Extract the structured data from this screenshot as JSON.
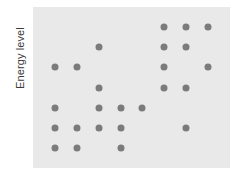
{
  "figure": {
    "background_color": "#ffffff",
    "panel_color": "#e9e9e9"
  },
  "axes": {
    "ylabel": "Energy level",
    "xlabel": ""
  },
  "chart_data": {
    "type": "scatter",
    "title": "",
    "subtitle": "",
    "xlabel": "",
    "ylabel": "Energy level",
    "grid": false,
    "legend": null,
    "marker": {
      "shape": "circle",
      "color": "#7b7b7b",
      "size_px": 7
    },
    "xlim": [
      0,
      9
    ],
    "ylim": [
      0,
      8
    ],
    "xticks": [],
    "yticks": [],
    "x": [
      6,
      7,
      8,
      3,
      6,
      7,
      1,
      2,
      6,
      8,
      3,
      6,
      7,
      1,
      3,
      4,
      5,
      1,
      2,
      3,
      4,
      7,
      1,
      2,
      4
    ],
    "y": [
      7,
      7,
      7,
      6,
      6,
      6,
      5,
      5,
      5,
      5,
      4,
      4,
      4,
      3,
      3,
      3,
      3,
      2,
      2,
      2,
      2,
      2,
      1,
      1,
      1
    ],
    "points": [
      {
        "x": 6,
        "y": 7
      },
      {
        "x": 7,
        "y": 7
      },
      {
        "x": 8,
        "y": 7
      },
      {
        "x": 3,
        "y": 6
      },
      {
        "x": 6,
        "y": 6
      },
      {
        "x": 7,
        "y": 6
      },
      {
        "x": 1,
        "y": 5
      },
      {
        "x": 2,
        "y": 5
      },
      {
        "x": 6,
        "y": 5
      },
      {
        "x": 8,
        "y": 5
      },
      {
        "x": 3,
        "y": 4
      },
      {
        "x": 6,
        "y": 4
      },
      {
        "x": 7,
        "y": 4
      },
      {
        "x": 1,
        "y": 3
      },
      {
        "x": 3,
        "y": 3
      },
      {
        "x": 4,
        "y": 3
      },
      {
        "x": 5,
        "y": 3
      },
      {
        "x": 1,
        "y": 2
      },
      {
        "x": 2,
        "y": 2
      },
      {
        "x": 3,
        "y": 2
      },
      {
        "x": 4,
        "y": 2
      },
      {
        "x": 7,
        "y": 2
      },
      {
        "x": 1,
        "y": 1
      },
      {
        "x": 2,
        "y": 1
      },
      {
        "x": 4,
        "y": 1
      }
    ],
    "point_count": 25,
    "rows": [
      {
        "level": 7,
        "columns": [
          6,
          7,
          8
        ],
        "count": 3
      },
      {
        "level": 6,
        "columns": [
          3,
          6,
          7
        ],
        "count": 3
      },
      {
        "level": 5,
        "columns": [
          1,
          2,
          6,
          8
        ],
        "count": 4
      },
      {
        "level": 4,
        "columns": [
          3,
          6,
          7
        ],
        "count": 3
      },
      {
        "level": 3,
        "columns": [
          1,
          3,
          4,
          5
        ],
        "count": 4
      },
      {
        "level": 2,
        "columns": [
          1,
          2,
          3,
          4,
          7
        ],
        "count": 5
      },
      {
        "level": 1,
        "columns": [
          1,
          2,
          4
        ],
        "count": 3
      }
    ]
  }
}
